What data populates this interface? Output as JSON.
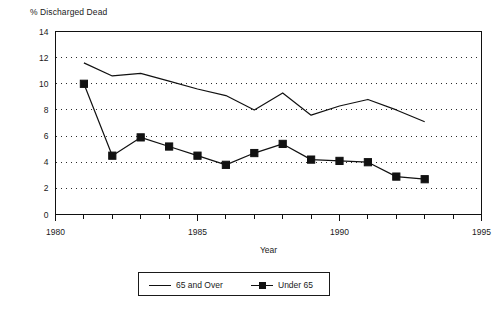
{
  "chart_data": {
    "type": "line",
    "title": "% Discharged Dead",
    "xlabel": "Year",
    "ylabel": "",
    "xlim": [
      1980,
      1995
    ],
    "ylim": [
      0,
      14
    ],
    "xticks": [
      1980,
      1985,
      1990,
      1995
    ],
    "yticks": [
      0,
      2,
      4,
      6,
      8,
      10,
      12,
      14
    ],
    "xtick_labels": [
      "1980",
      "1985",
      "1990",
      "1995"
    ],
    "ytick_labels": [
      "0",
      "2",
      "4",
      "6",
      "8",
      "10",
      "12",
      "14"
    ],
    "grid": "horizontal-dotted",
    "legend_position": "bottom-center",
    "x": [
      1981,
      1982,
      1983,
      1984,
      1985,
      1986,
      1987,
      1988,
      1989,
      1990,
      1991,
      1992,
      1993
    ],
    "series": [
      {
        "name": "65 and Over",
        "marker": "none",
        "color": "#111111",
        "values": [
          11.6,
          10.6,
          10.8,
          10.2,
          9.6,
          9.1,
          8.0,
          9.3,
          7.6,
          8.3,
          8.8,
          8.0,
          7.1
        ]
      },
      {
        "name": "Under 65",
        "marker": "square",
        "color": "#111111",
        "values": [
          10.0,
          4.5,
          5.9,
          5.2,
          4.5,
          3.8,
          4.7,
          5.4,
          4.2,
          4.1,
          4.0,
          2.9,
          2.7
        ]
      }
    ]
  },
  "legend": {
    "items": [
      {
        "label": "65 and Over"
      },
      {
        "label": "Under 65"
      }
    ]
  }
}
